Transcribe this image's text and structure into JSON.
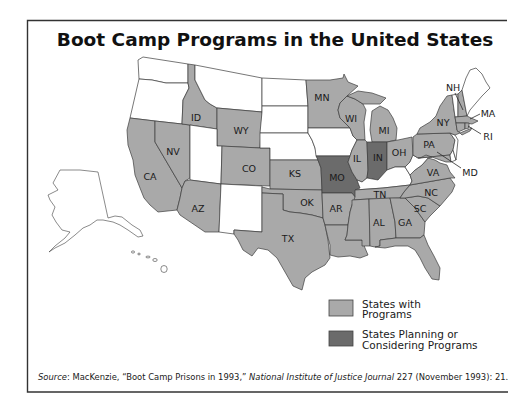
{
  "title": "Boot Camp Programs in the United States",
  "colors": {
    "programs": "#a9a9a9",
    "planning": "#6b6b6b",
    "none": "#ffffff"
  },
  "states": {
    "WA": "none",
    "OR": "none",
    "CA": "programs",
    "NV": "programs",
    "ID": "programs",
    "MT": "none",
    "WY": "programs",
    "UT": "none",
    "AZ": "programs",
    "NM": "none",
    "CO": "programs",
    "ND": "none",
    "SD": "none",
    "NE": "none",
    "KS": "programs",
    "OK": "programs",
    "TX": "programs",
    "MN": "programs",
    "IA": "none",
    "MO": "planning",
    "AR": "programs",
    "LA": "programs",
    "WI": "programs",
    "IL": "programs",
    "MI": "programs",
    "IN": "planning",
    "OH": "programs",
    "KY": "none",
    "TN": "programs",
    "MS": "programs",
    "AL": "programs",
    "GA": "programs",
    "FL": "programs",
    "SC": "programs",
    "NC": "programs",
    "VA": "programs",
    "WV": "none",
    "PA": "programs",
    "NY": "programs",
    "NJ": "none",
    "DE": "none",
    "MD": "programs",
    "VT": "none",
    "NH": "programs",
    "ME": "none",
    "MA": "programs",
    "CT": "programs",
    "RI": "programs",
    "AK": "none",
    "HI": "none"
  },
  "labels": {
    "ID": "ID",
    "WY": "WY",
    "NV": "NV",
    "CA": "CA",
    "CO": "CO",
    "AZ": "AZ",
    "MN": "MN",
    "WI": "WI",
    "MI": "MI",
    "IL": "IL",
    "IN": "IN",
    "MO": "MO",
    "KS": "KS",
    "OK": "OK",
    "TX": "TX",
    "AR": "AR",
    "TN": "TN",
    "AL": "AL",
    "GA": "GA",
    "SC": "SC",
    "NC": "NC",
    "VA": "VA",
    "OH": "OH",
    "PA": "PA",
    "NY": "NY",
    "NH": "NH",
    "MA": "MA",
    "RI": "RI",
    "MD": "MD"
  },
  "legend": [
    {
      "key": "programs",
      "line1": "States with",
      "line2": "Programs"
    },
    {
      "key": "planning",
      "line1": "States Planning or",
      "line2": "Considering Programs"
    }
  ],
  "source": {
    "label": "Source",
    "text1": ": MacKenzie, “Boot Camp Prisons in 1993,” ",
    "journal": "National Institute of Justice Journal",
    "text2": " 227 (November 1993): 21."
  }
}
